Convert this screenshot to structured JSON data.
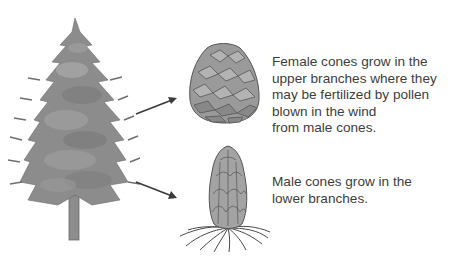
{
  "diagram": {
    "tree": {
      "label": "pine-tree"
    },
    "female_cone": {
      "caption_lines": [
        "Female cones grow in the",
        "upper branches where they",
        "may be fertilized by pollen",
        "blown in the wind",
        "from male cones."
      ]
    },
    "male_cone": {
      "caption_lines": [
        "Male cones grow in the",
        "lower branches."
      ]
    },
    "colors": {
      "tree_dark": "#6e6e6e",
      "tree_mid": "#8a8a8a",
      "tree_light": "#a8a8a8",
      "cone_fill": "#9a9a9a",
      "cone_stroke": "#555555",
      "arrow": "#3a3a3a",
      "text": "#3d3d3d"
    }
  }
}
